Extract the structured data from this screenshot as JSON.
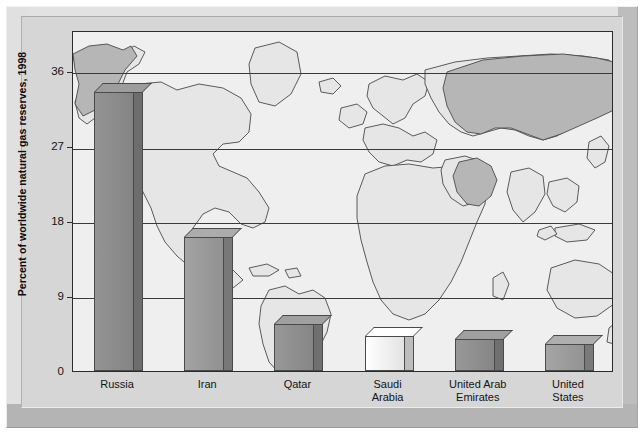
{
  "chart_data": {
    "type": "bar",
    "title": "",
    "subtitle": "",
    "xlabel": "",
    "ylabel": "Percent of worldwide natural gas reserves, 1998",
    "categories": [
      "Russia",
      "Iran",
      "Qatar",
      "Saudi Arabia",
      "United Arab Emirates",
      "United States"
    ],
    "values": [
      33.5,
      16.1,
      5.6,
      4.2,
      3.8,
      3.2
    ],
    "ylim": [
      0,
      40
    ],
    "yticks": [
      0,
      9,
      18,
      27,
      36
    ],
    "ytick_labels": [
      "0",
      "9",
      "18",
      "27",
      "36"
    ],
    "grid": true,
    "legend": "none",
    "bar_colors": [
      "#8c8c8c",
      "#9a9a9a",
      "#8f8f8f",
      "#f2f2f2",
      "#8f8f8f",
      "#9c9c9c"
    ],
    "background": "world-map",
    "annotations": []
  },
  "axis": {
    "y_label": "Percent of worldwide natural gas reserves, 1998",
    "ticks": [
      {
        "label": "36",
        "value": 36
      },
      {
        "label": "27",
        "value": 27
      },
      {
        "label": "18",
        "value": 18
      },
      {
        "label": "9",
        "value": 9
      },
      {
        "label": "0",
        "value": 0
      }
    ]
  },
  "categories": [
    {
      "name": "country-russia",
      "line1": "Russia",
      "line2": ""
    },
    {
      "name": "country-iran",
      "line1": "Iran",
      "line2": ""
    },
    {
      "name": "country-qatar",
      "line1": "Qatar",
      "line2": ""
    },
    {
      "name": "country-saudi",
      "line1": "Saudi",
      "line2": "Arabia"
    },
    {
      "name": "country-uae",
      "line1": "United Arab",
      "line2": "Emirates"
    },
    {
      "name": "country-usa",
      "line1": "United",
      "line2": "States"
    }
  ],
  "colors": {
    "plot_background": "#efefef",
    "frame": "#d6d6d6",
    "gridline": "#3a3a3a",
    "map_land": "#e8e8e8",
    "map_highlight": "#b8b8b8",
    "bar_default": "#909090",
    "bar_light": "#f2f2f2"
  }
}
